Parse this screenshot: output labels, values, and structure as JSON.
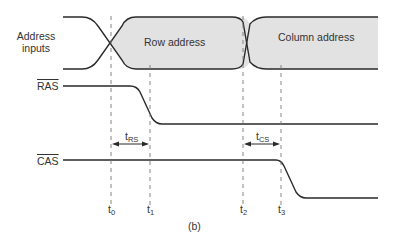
{
  "diagram": {
    "caption": "(b)",
    "signals": {
      "address": {
        "label_line1": "Address",
        "label_line2": "inputs",
        "row_label": "Row address",
        "column_label": "Column address"
      },
      "ras": {
        "label": "RAS"
      },
      "cas": {
        "label": "CAS"
      }
    },
    "timing": {
      "t_rs": {
        "base": "t",
        "sub": "RS"
      },
      "t_cs": {
        "base": "t",
        "sub": "CS"
      }
    },
    "time_markers": [
      {
        "base": "t",
        "sub": "0"
      },
      {
        "base": "t",
        "sub": "1"
      },
      {
        "base": "t",
        "sub": "2"
      },
      {
        "base": "t",
        "sub": "3"
      }
    ],
    "colors": {
      "line": "#2a2a2a",
      "fill": "#e2e2e2",
      "dash": "#777777"
    }
  }
}
